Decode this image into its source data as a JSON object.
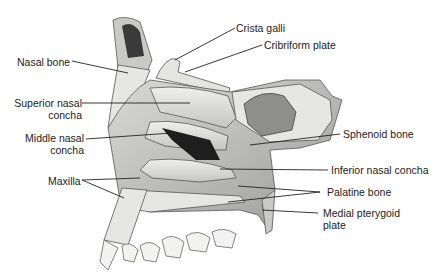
{
  "figure": {
    "labels": {
      "crista_galli": "Crista galli",
      "cribriform_plate": "Cribriform plate",
      "nasal_bone": "Nasal bone",
      "superior_nasal_concha_1": "Superior nasal",
      "superior_nasal_concha_2": "concha",
      "middle_nasal_concha_1": "Middle nasal",
      "middle_nasal_concha_2": "concha",
      "maxilla": "Maxilla",
      "sphenoid_bone": "Sphenoid bone",
      "inferior_nasal_concha": "Inferior nasal concha",
      "palatine_bone": "Palatine bone",
      "medial_pterygoid_plate_1": "Medial pterygoid",
      "medial_pterygoid_plate_2": "plate"
    },
    "colors": {
      "bone_light": "#e8e8e6",
      "bone_mid": "#bdbdbb",
      "bone_dark": "#7a7a78",
      "cavity": "#1e1e1e",
      "line": "#222222"
    }
  }
}
